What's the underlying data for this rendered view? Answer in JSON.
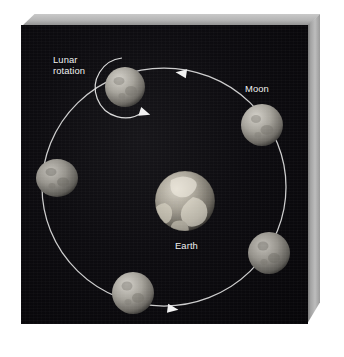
{
  "figure": {
    "background_color": "#ffffff",
    "panel_color": "#0d0c10",
    "bevel_color": "#b3b3b3",
    "line_color": "#e8e8e8",
    "label_color": "#f2f2f2"
  },
  "labels": {
    "lunar_rotation": "Lunar\nrotation",
    "moon": "Moon",
    "earth": "Earth"
  },
  "bodies": {
    "earth": {
      "name": "Earth",
      "cx": 164,
      "cy": 176,
      "r": 30,
      "color": "#b7b3a9"
    },
    "moons": [
      {
        "position": "top-left",
        "cx": 104,
        "cy": 62,
        "rx": 20,
        "ry": 20
      },
      {
        "position": "right",
        "cx": 241,
        "cy": 100,
        "rx": 21,
        "ry": 21
      },
      {
        "position": "bottom-right",
        "cx": 248,
        "cy": 228,
        "rx": 21,
        "ry": 21
      },
      {
        "position": "bottom",
        "cx": 112,
        "cy": 268,
        "rx": 21,
        "ry": 21
      },
      {
        "position": "left",
        "cx": 36,
        "cy": 153,
        "rx": 21,
        "ry": 19
      }
    ]
  },
  "orbit": {
    "cx": 143,
    "cy": 162,
    "rx": 122,
    "ry": 119,
    "direction": "counterclockwise",
    "arrows": [
      {
        "name": "orbit-arrow-top",
        "x": 160,
        "y": 48,
        "angle": 188
      },
      {
        "name": "orbit-arrow-bottom",
        "x": 152,
        "y": 284,
        "angle": 8
      }
    ]
  },
  "rotation_arc": {
    "name": "lunar-rotation-arc",
    "cx": 104,
    "cy": 64,
    "r": 29,
    "arrow": {
      "x": 119,
      "y": 90,
      "angle": 25
    }
  },
  "icons": {
    "earth_icon": "earth-globe-icon",
    "moon_icon": "moon-icon",
    "arrow_icon": "arrowhead-icon"
  }
}
